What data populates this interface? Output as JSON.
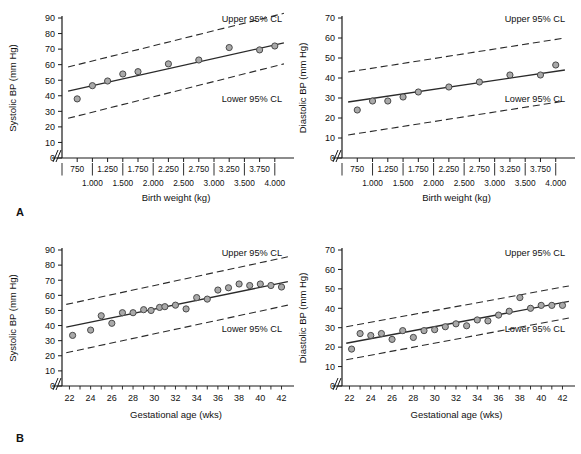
{
  "figure": {
    "panels": [
      {
        "key": "A",
        "label": "A"
      },
      {
        "key": "B",
        "label": "B"
      }
    ]
  },
  "annotations": {
    "upper_cl": "Upper 95% CL",
    "lower_cl": "Lower 95% CL"
  },
  "chart_data": [
    {
      "id": "a-systolic-birthweight",
      "panel": "A",
      "type": "scatter",
      "title": "",
      "xlabel": "Birth weight (kg)",
      "ylabel": "Systolic BP (mm Hg)",
      "xlim": [
        0.5,
        4.25
      ],
      "ylim": [
        0,
        90
      ],
      "yticks": [
        0,
        10,
        20,
        30,
        40,
        50,
        60,
        70,
        80,
        90
      ],
      "ytick_labels": [
        "0",
        "10",
        "20",
        "30",
        "40",
        "50",
        "60",
        "70",
        "80",
        "90"
      ],
      "axis_break": true,
      "grid": false,
      "x_tick_rows": [
        {
          "values": [
            0.75,
            1.25,
            1.75,
            2.25,
            2.75,
            3.25,
            3.75
          ],
          "labels": [
            "750",
            "1.250",
            "1.750",
            "2.250",
            "2.750",
            "3.250",
            "3.750"
          ]
        },
        {
          "values": [
            1.0,
            1.5,
            2.0,
            2.5,
            3.0,
            3.5,
            4.0
          ],
          "labels": [
            "1.000",
            "1.500",
            "2.000",
            "2.500",
            "3.000",
            "3.500",
            "4.000"
          ]
        }
      ],
      "x": [
        0.75,
        1.0,
        1.25,
        1.5,
        1.75,
        2.25,
        2.75,
        3.25,
        3.75,
        4.0
      ],
      "values": [
        38,
        46.5,
        49.5,
        54,
        55.5,
        60.5,
        63,
        71,
        69.5,
        72
      ],
      "fit_line": {
        "name": "Regression line",
        "x": [
          0.6,
          4.15
        ],
        "y": [
          43,
          74
        ]
      },
      "upper_cl": {
        "name": "Upper 95% CL",
        "x": [
          0.6,
          4.15
        ],
        "y": [
          58.5,
          93
        ]
      },
      "lower_cl": {
        "name": "Lower 95% CL",
        "x": [
          0.6,
          4.15
        ],
        "y": [
          25.5,
          60.5
        ]
      },
      "legend": [
        "Upper 95% CL",
        "Lower 95% CL"
      ],
      "legend_position": "inside-plot"
    },
    {
      "id": "a-diastolic-birthweight",
      "panel": "A",
      "type": "scatter",
      "title": "",
      "xlabel": "Birth weight (kg)",
      "ylabel": "Diastolic BP (mm Hg)",
      "xlim": [
        0.5,
        4.25
      ],
      "ylim": [
        0,
        70
      ],
      "yticks": [
        0,
        10,
        20,
        30,
        40,
        50,
        60,
        70
      ],
      "ytick_labels": [
        "0",
        "10",
        "20",
        "30",
        "40",
        "50",
        "60",
        "70"
      ],
      "axis_break": true,
      "grid": false,
      "x_tick_rows": [
        {
          "values": [
            0.75,
            1.25,
            1.75,
            2.25,
            2.75,
            3.25,
            3.75
          ],
          "labels": [
            "750",
            "1.250",
            "1.750",
            "2.250",
            "2.750",
            "3.250",
            "3.750"
          ]
        },
        {
          "values": [
            1.0,
            1.5,
            2.0,
            2.5,
            3.0,
            3.5,
            4.0
          ],
          "labels": [
            "1.000",
            "1.500",
            "2.000",
            "2.500",
            "3.000",
            "3.500",
            "4.000"
          ]
        }
      ],
      "x": [
        0.75,
        1.0,
        1.25,
        1.5,
        1.75,
        2.25,
        2.75,
        3.25,
        3.75,
        4.0
      ],
      "values": [
        24,
        28.5,
        28.5,
        30.5,
        33,
        35.5,
        38,
        41.5,
        41.5,
        46.5
      ],
      "fit_line": {
        "name": "Regression line",
        "x": [
          0.6,
          4.15
        ],
        "y": [
          28,
          44
        ]
      },
      "upper_cl": {
        "name": "Upper 95% CL",
        "x": [
          0.6,
          4.15
        ],
        "y": [
          43,
          60
        ]
      },
      "lower_cl": {
        "name": "Lower 95% CL",
        "x": [
          0.6,
          4.15
        ],
        "y": [
          11.5,
          28.5
        ]
      },
      "legend": [
        "Upper 95% CL",
        "Lower 95% CL"
      ],
      "legend_position": "inside-plot"
    },
    {
      "id": "b-systolic-gestational",
      "panel": "B",
      "type": "scatter",
      "title": "",
      "xlabel": "Gestational age (wks)",
      "ylabel": "Systolic BP (mm Hg)",
      "xlim": [
        21.3,
        42.8
      ],
      "ylim": [
        0,
        90
      ],
      "yticks": [
        0,
        10,
        20,
        30,
        40,
        50,
        60,
        70,
        80,
        90
      ],
      "ytick_labels": [
        "0",
        "10",
        "20",
        "30",
        "40",
        "50",
        "60",
        "70",
        "80",
        "90"
      ],
      "axis_break": true,
      "grid": false,
      "xticks_minor": [
        22,
        23,
        24,
        25,
        26,
        27,
        28,
        29,
        30,
        31,
        32,
        33,
        34,
        35,
        36,
        37,
        38,
        39,
        40,
        41,
        42
      ],
      "xticks": [
        22,
        24,
        26,
        28,
        30,
        32,
        34,
        36,
        38,
        40,
        42
      ],
      "xtick_labels": [
        "22",
        "24",
        "26",
        "28",
        "30",
        "32",
        "34",
        "36",
        "38",
        "40",
        "42"
      ],
      "x": [
        22.3,
        24,
        25,
        26,
        27,
        28,
        29,
        29.7,
        30.5,
        31,
        32,
        33,
        34,
        35,
        36,
        37,
        38,
        39,
        40,
        41,
        42
      ],
      "values": [
        33.5,
        37,
        46.5,
        41.5,
        48.5,
        48.5,
        50.5,
        50,
        52,
        52.5,
        53.5,
        51,
        58.5,
        57.5,
        63.5,
        65,
        67.5,
        66.5,
        67.5,
        66.5,
        65.5
      ],
      "fit_line": {
        "name": "Regression line",
        "x": [
          21.7,
          42.6
        ],
        "y": [
          39,
          69
        ]
      },
      "upper_cl": {
        "name": "Upper 95% CL",
        "x": [
          21.7,
          42.6
        ],
        "y": [
          54,
          85.5
        ]
      },
      "lower_cl": {
        "name": "Lower 95% CL",
        "x": [
          21.7,
          42.6
        ],
        "y": [
          22,
          53.5
        ]
      },
      "legend": [
        "Upper 95% CL",
        "Lower 95% CL"
      ],
      "legend_position": "inside-plot"
    },
    {
      "id": "b-diastolic-gestational",
      "panel": "B",
      "type": "scatter",
      "title": "",
      "xlabel": "Gestational age (wks)",
      "ylabel": "Diastolic BP (mm Hg)",
      "xlim": [
        21.3,
        42.8
      ],
      "ylim": [
        0,
        70
      ],
      "yticks": [
        0,
        10,
        20,
        30,
        40,
        50,
        60,
        70
      ],
      "ytick_labels": [
        "0",
        "10",
        "20",
        "30",
        "40",
        "50",
        "60",
        "70"
      ],
      "axis_break": true,
      "grid": false,
      "xticks_minor": [
        22,
        23,
        24,
        25,
        26,
        27,
        28,
        29,
        30,
        31,
        32,
        33,
        34,
        35,
        36,
        37,
        38,
        39,
        40,
        41,
        42
      ],
      "xticks": [
        22,
        24,
        26,
        28,
        30,
        32,
        34,
        36,
        38,
        40,
        42
      ],
      "xtick_labels": [
        "22",
        "24",
        "26",
        "28",
        "30",
        "32",
        "34",
        "36",
        "38",
        "40",
        "42"
      ],
      "x": [
        22.2,
        23,
        24,
        25,
        26,
        27,
        28,
        29,
        30,
        31,
        32,
        33,
        34,
        35,
        36,
        37,
        38,
        39,
        40,
        41,
        42
      ],
      "values": [
        19,
        27,
        26,
        27,
        24,
        28.5,
        25,
        28.5,
        29,
        30.5,
        32,
        31,
        34,
        33.5,
        36.5,
        38.5,
        45.5,
        40,
        41.5,
        41.5,
        41.5
      ],
      "fit_line": {
        "name": "Regression line",
        "x": [
          21.7,
          42.6
        ],
        "y": [
          22,
          43.5
        ]
      },
      "upper_cl": {
        "name": "Upper 95% CL",
        "x": [
          21.7,
          42.6
        ],
        "y": [
          30.5,
          51.5
        ]
      },
      "lower_cl": {
        "name": "Lower 95% CL",
        "x": [
          21.7,
          42.6
        ],
        "y": [
          13.5,
          35
        ]
      },
      "legend": [
        "Upper 95% CL",
        "Lower 95% CL"
      ],
      "legend_position": "inside-plot"
    }
  ]
}
